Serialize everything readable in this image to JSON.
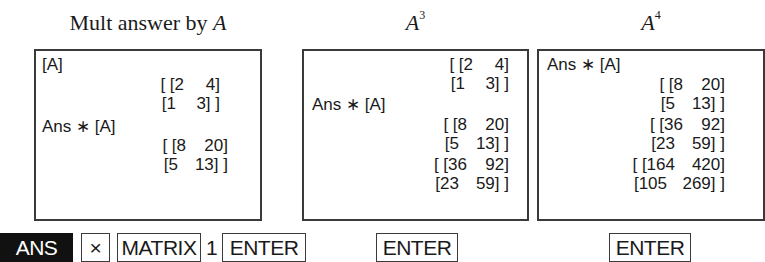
{
  "panels": [
    {
      "caption_text": "Mult answer by ",
      "caption_var": "A",
      "caption_exp": "",
      "lines": [
        {
          "type": "text",
          "value": "[A]"
        },
        {
          "type": "matrix",
          "rows": [
            [
              "[ [2",
              "4]"
            ],
            [
              "[1",
              "3] ]"
            ]
          ]
        },
        {
          "type": "text",
          "value": "Ans ∗ [A]"
        },
        {
          "type": "matrix",
          "rows": [
            [
              "[ [8",
              "20]"
            ],
            [
              "[5",
              "13] ]"
            ]
          ]
        }
      ]
    },
    {
      "caption_text": "",
      "caption_var": "A",
      "caption_exp": "3",
      "lines": [
        {
          "type": "matrix",
          "rows": [
            [
              "[ [2",
              "4]"
            ],
            [
              "[1",
              "3] ]"
            ]
          ]
        },
        {
          "type": "text",
          "value": "Ans ∗ [A]"
        },
        {
          "type": "matrix",
          "rows": [
            [
              "[ [8",
              "20]"
            ],
            [
              "[5",
              "13] ]"
            ]
          ]
        },
        {
          "type": "matrix",
          "rows": [
            [
              "[ [36",
              "92]"
            ],
            [
              "[23",
              "59] ]"
            ]
          ]
        }
      ]
    },
    {
      "caption_text": "",
      "caption_var": "A",
      "caption_exp": "4",
      "lines": [
        {
          "type": "text",
          "value": "Ans ∗ [A]"
        },
        {
          "type": "matrix",
          "rows": [
            [
              "[ [8",
              "20]"
            ],
            [
              "[5",
              "13] ]"
            ]
          ]
        },
        {
          "type": "matrix",
          "rows": [
            [
              "[ [36",
              "92]"
            ],
            [
              "[23",
              "59] ]"
            ]
          ]
        },
        {
          "type": "matrix",
          "rows": [
            [
              "[ [164",
              "420]"
            ],
            [
              "[105",
              "269] ]"
            ]
          ]
        }
      ]
    }
  ],
  "keys": {
    "ans": "ANS",
    "times": "×",
    "matrix": "MATRIX",
    "one": "1",
    "enter1": "ENTER",
    "enter2": "ENTER",
    "enter3": "ENTER"
  }
}
